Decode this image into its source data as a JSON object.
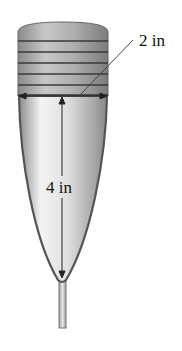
{
  "figure": {
    "object": "conical paper cup in holder",
    "labels": {
      "diameter": "2 in",
      "height": "4 in"
    },
    "dimensions": {
      "diameter_in": 2,
      "height_in": 4
    },
    "colors": {
      "cup_fill_light": "#f2f2f2",
      "cup_fill_dark": "#9a9a9a",
      "outline": "#555555",
      "holder_band": "#8a8a8a",
      "holder_stripe": "#444444",
      "dimension_line": "#222222"
    }
  }
}
